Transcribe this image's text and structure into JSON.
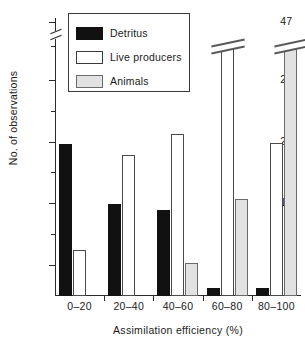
{
  "chart_data": {
    "type": "bar",
    "title": "",
    "xlabel": "Assimilation efficiency (%)",
    "ylabel": "No. of observations",
    "categories": [
      "0–20",
      "20–40",
      "40–60",
      "60–80",
      "80–100"
    ],
    "series": [
      {
        "name": "Detritus",
        "color": "#111111",
        "values": [
          19.7,
          11.9,
          11.2,
          1,
          1
        ]
      },
      {
        "name": "Live producers",
        "color": "#ffffff",
        "values": [
          6,
          18.3,
          21,
          31.5,
          19.8
        ]
      },
      {
        "name": "Animals",
        "color": "#e2e2e2",
        "values": [
          0,
          0,
          4.3,
          12.5,
          47
        ]
      }
    ],
    "ylim": [
      0,
      36
    ],
    "yticks": [
      4,
      12,
      20,
      28,
      47
    ],
    "ytick_labels": [
      "4",
      "12",
      "20",
      "28",
      "47"
    ],
    "y_minor_ticks": [
      8,
      16,
      24,
      32
    ],
    "axis_break": {
      "present": true,
      "between": [
        28,
        47
      ],
      "axis": "y"
    },
    "broken_bars": [
      {
        "category": "80–100",
        "series": "Animals",
        "value": 47
      }
    ],
    "grid": false,
    "legend_position": "top-left",
    "legend_entries": [
      "Detritus",
      "Live producers",
      "Animals"
    ]
  },
  "legend": {
    "items": [
      {
        "label": "Detritus",
        "swatch": "black-swatch"
      },
      {
        "label": "Live producers",
        "swatch": "white-swatch"
      },
      {
        "label": "Animals",
        "swatch": "gray-swatch"
      }
    ]
  },
  "axes": {
    "y_title": "No. of observations",
    "x_title": "Assimilation efficiency (%)",
    "y_labels": [
      "47",
      "28",
      "20",
      "12",
      "4"
    ],
    "x_labels": [
      "0–20",
      "20–40",
      "40–60",
      "60–80",
      "80–100"
    ]
  }
}
